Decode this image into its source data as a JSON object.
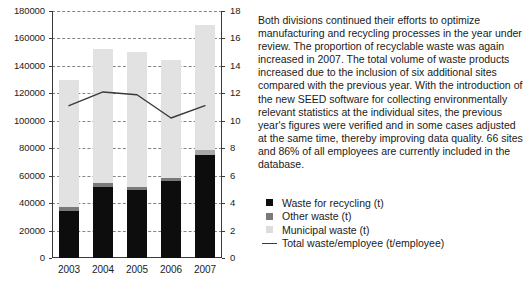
{
  "chart_data": {
    "type": "bar",
    "title": "",
    "xlabel": "",
    "ylabel": "",
    "categories": [
      "2003",
      "2004",
      "2005",
      "2006",
      "2007"
    ],
    "grid": true,
    "legend_position": "right",
    "y_left": {
      "label": "",
      "ylim": [
        0,
        180000
      ],
      "ticks": [
        0,
        20000,
        40000,
        60000,
        80000,
        100000,
        120000,
        140000,
        160000,
        180000
      ],
      "tick_labels": [
        "0",
        "20000",
        "40000",
        "60000",
        "80000",
        "100000",
        "120000",
        "140000",
        "160000",
        "180000"
      ]
    },
    "y_right": {
      "label": "",
      "ylim": [
        0,
        18
      ],
      "ticks": [
        0,
        2,
        4,
        6,
        8,
        10,
        12,
        14,
        16,
        18
      ],
      "tick_labels": [
        "0",
        "2",
        "4",
        "6",
        "8",
        "10",
        "12",
        "14",
        "16",
        "18"
      ]
    },
    "stacked": true,
    "series": [
      {
        "name": "Waste for recycling (t)",
        "color": "#0d0d0d",
        "axis": "left",
        "values": [
          34500,
          52000,
          49500,
          56000,
          75000
        ]
      },
      {
        "name": "Other waste (t)",
        "color": "#7a7a7a",
        "axis": "left",
        "values": [
          3000,
          3000,
          2500,
          2500,
          3500
        ]
      },
      {
        "name": "Municipal waste (t)",
        "color": "#e2e2e2",
        "axis": "left",
        "values": [
          92500,
          97000,
          98000,
          85500,
          91500
        ]
      }
    ],
    "line_series": {
      "name": "Total waste/employee (t/employee)",
      "color": "#3a3a3a",
      "axis": "right",
      "values": [
        11.1,
        12.1,
        11.9,
        10.2,
        11.1
      ]
    },
    "stack_totals": [
      130000,
      152000,
      150000,
      144000,
      170000
    ]
  },
  "legend": {
    "items": [
      {
        "label": "Waste for recycling (t)",
        "swatch": "square-black"
      },
      {
        "label": "Other waste (t)",
        "swatch": "square-gray"
      },
      {
        "label": "Municipal waste (t)",
        "swatch": "square-light-gray"
      },
      {
        "label": "Total waste/employee (t/employee)",
        "swatch": "line-dark"
      }
    ]
  },
  "description": {
    "text": "Both divisions continued their efforts to optimize manufacturing and recycling processes in the year under review. The proportion of recyclable waste was again increased in 2007. The total volume of waste products increased due to the inclusion of six additional sites compared with the previous year. With the introduction of the new SEED software for collecting environmentally relevant statistics at the individual sites, the previous year's figures were verified and in some cases adjusted at the same time, thereby improving data quality. 66 sites and 86% of all employees are currently included in the database."
  }
}
